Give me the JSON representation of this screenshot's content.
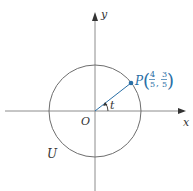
{
  "diagram": {
    "circle_label": "U",
    "origin_label": "O",
    "x_axis_label": "x",
    "y_axis_label": "y",
    "angle_label": "t",
    "point": {
      "name": "P",
      "x_num": "4",
      "x_den": "5",
      "y_num": "3",
      "y_den": "5",
      "x_value": 0.8,
      "y_value": 0.6
    },
    "colors": {
      "axis": "#8c8c8c",
      "circle": "#6e6e6e",
      "point_and_radius": "#2a6fa6",
      "text": "#333333"
    }
  }
}
